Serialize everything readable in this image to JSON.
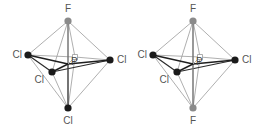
{
  "figure": {
    "background_color": "#ffffff",
    "width": 265,
    "height": 131
  },
  "colors": {
    "chlorine_vertex": "#1a1a1a",
    "fluorine_vertex": "#8a8a8a",
    "bond_front": "#2b2b2b",
    "bond_back": "#b0b0b0",
    "bond_edge": "#9a9a9a",
    "label_text": "#555555",
    "center_text": "#444444"
  },
  "molecules": [
    {
      "id": "molecule-left",
      "name": "cis-isomer",
      "center": {
        "label": "P",
        "x": 68,
        "y": 64,
        "label_x": 71,
        "label_y": 62
      },
      "atoms": [
        {
          "id": "left-top",
          "label": "F",
          "element": "F",
          "x": 68,
          "y": 21,
          "r": 3.6,
          "color": "#8a8a8a",
          "label_x": 68,
          "label_y": 9,
          "anchor": "middle"
        },
        {
          "id": "left-west",
          "label": "Cl",
          "element": "Cl",
          "x": 28,
          "y": 55,
          "r": 3.6,
          "color": "#1a1a1a",
          "label_x": 22,
          "label_y": 55,
          "anchor": "end"
        },
        {
          "id": "left-east",
          "label": "Cl",
          "element": "Cl",
          "x": 110,
          "y": 60,
          "r": 3.6,
          "color": "#1a1a1a",
          "label_x": 117,
          "label_y": 60,
          "anchor": "start"
        },
        {
          "id": "left-front",
          "label": "Cl",
          "element": "Cl",
          "x": 52,
          "y": 72,
          "r": 3.6,
          "color": "#1a1a1a",
          "label_x": 44,
          "label_y": 80,
          "anchor": "end"
        },
        {
          "id": "left-back",
          "label": "",
          "element": "Cl",
          "x": 75,
          "y": 57,
          "r": 2.4,
          "color": "#b0b0b0",
          "label_x": 75,
          "label_y": 50,
          "anchor": "middle"
        },
        {
          "id": "left-bottom",
          "label": "Cl",
          "element": "Cl",
          "x": 68,
          "y": 108,
          "r": 3.6,
          "color": "#1a1a1a",
          "label_x": 68,
          "label_y": 121,
          "anchor": "middle"
        }
      ]
    },
    {
      "id": "molecule-right",
      "name": "trans-isomer",
      "center": {
        "label": "P",
        "x": 193,
        "y": 64,
        "label_x": 196,
        "label_y": 62
      },
      "atoms": [
        {
          "id": "right-top",
          "label": "F",
          "element": "F",
          "x": 193,
          "y": 21,
          "r": 3.6,
          "color": "#8a8a8a",
          "label_x": 193,
          "label_y": 9,
          "anchor": "middle"
        },
        {
          "id": "right-west",
          "label": "Cl",
          "element": "Cl",
          "x": 153,
          "y": 55,
          "r": 3.6,
          "color": "#1a1a1a",
          "label_x": 147,
          "label_y": 55,
          "anchor": "end"
        },
        {
          "id": "right-east",
          "label": "Cl",
          "element": "Cl",
          "x": 235,
          "y": 60,
          "r": 3.6,
          "color": "#1a1a1a",
          "label_x": 242,
          "label_y": 60,
          "anchor": "start"
        },
        {
          "id": "right-front",
          "label": "Cl",
          "element": "Cl",
          "x": 177,
          "y": 72,
          "r": 3.6,
          "color": "#1a1a1a",
          "label_x": 169,
          "label_y": 80,
          "anchor": "end"
        },
        {
          "id": "right-back",
          "label": "",
          "element": "Cl",
          "x": 200,
          "y": 57,
          "r": 2.4,
          "color": "#b0b0b0",
          "label_x": 200,
          "label_y": 50,
          "anchor": "middle"
        },
        {
          "id": "right-bottom",
          "label": "F",
          "element": "F",
          "x": 193,
          "y": 108,
          "r": 3.6,
          "color": "#8a8a8a",
          "label_x": 193,
          "label_y": 121,
          "anchor": "middle"
        }
      ]
    }
  ]
}
